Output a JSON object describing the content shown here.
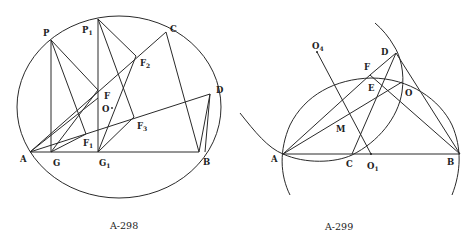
{
  "figures": [
    {
      "caption": "A-298",
      "labels": {
        "P": "P",
        "P1": "P",
        "P1_sub": "1",
        "C": "C",
        "D": "D",
        "F2": "F",
        "F2_sub": "2",
        "F": "F",
        "O": "O",
        "F3": "F",
        "F3_sub": "3",
        "F1": "F",
        "F1_sub": "1",
        "A": "A",
        "G": "G",
        "G1": "G",
        "G1_sub": "1",
        "B": "B"
      }
    },
    {
      "caption": "A-299",
      "labels": {
        "D": "D",
        "F": "F",
        "O4": "O",
        "O4_sub": "4",
        "E": "E",
        "O": "O",
        "M": "M",
        "A": "A",
        "C": "C",
        "O1": "O",
        "O1_sub": "1",
        "B": "B"
      }
    }
  ]
}
